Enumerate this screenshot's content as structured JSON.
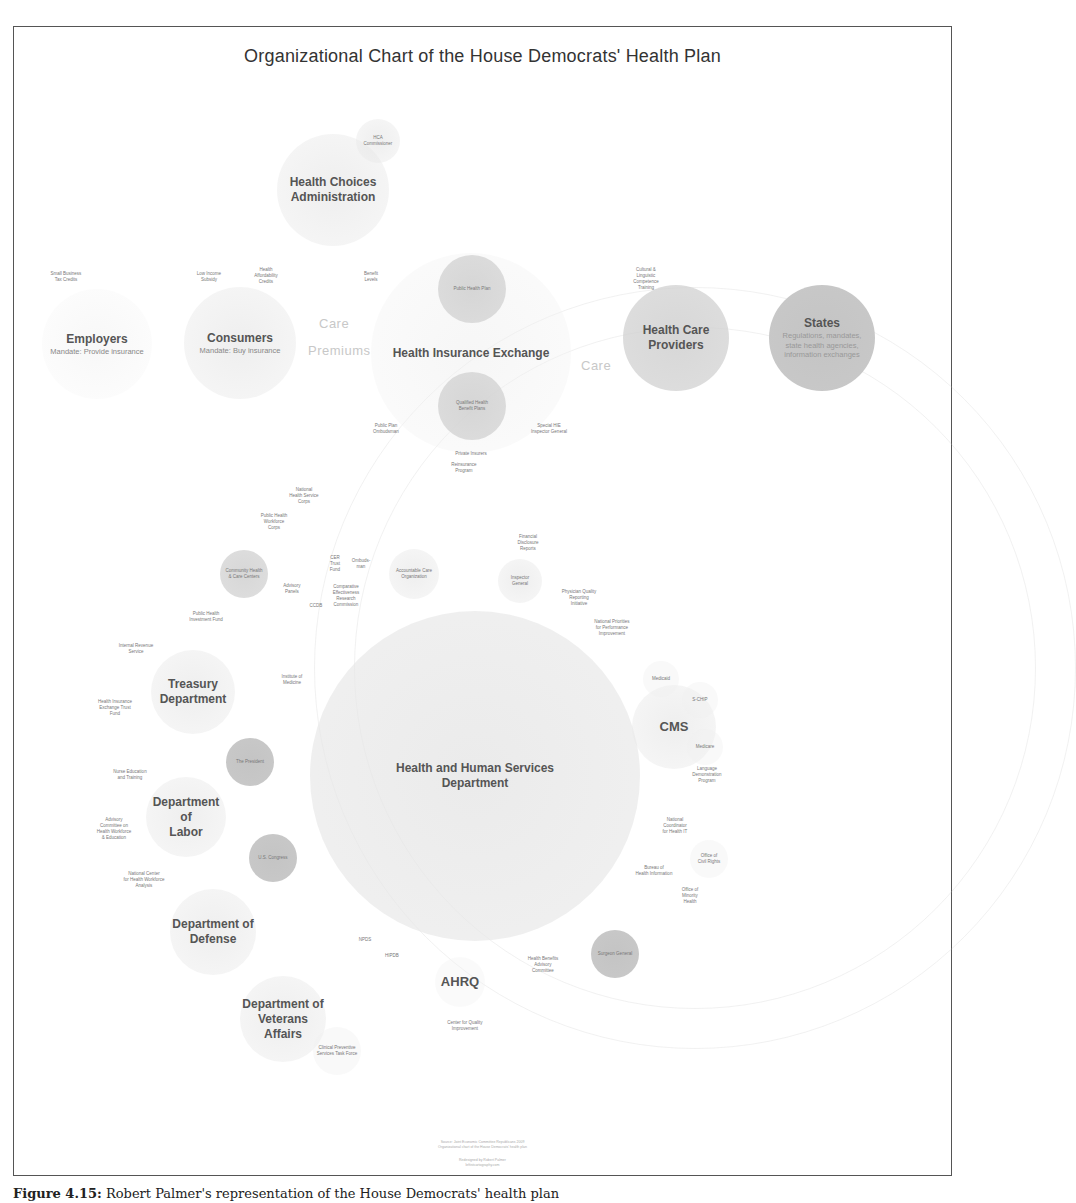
{
  "figure": {
    "title": "Organizational Chart of the House Democrats' Health Plan",
    "caption_label": "Figure 4.15:",
    "caption_text": "Robert Palmer's representation of the House Democrats' health plan"
  },
  "colors": {
    "frame_border": "#555555",
    "title_text": "#333333",
    "node_light": "#e6e6e6",
    "node_dark": "#c6c6c6",
    "label_text": "#555555",
    "flow_text": "#c8c8c8"
  },
  "top_nodes": {
    "health_choices_admin": {
      "label_line1": "Health Choices",
      "label_line2": "Administration"
    },
    "hca_commissioner": {
      "label_line1": "HCA",
      "label_line2": "Commissioner"
    },
    "employers": {
      "label": "Employers",
      "sublabel": "Mandate: Provide insurance"
    },
    "small_business_tax_credits": "Small Business\nTax Credits",
    "consumers": {
      "label": "Consumers",
      "sublabel": "Mandate: Buy insurance"
    },
    "low_income_subsidy": "Low Income\nSubsidy",
    "health_affordability_credits": "Health\nAffordability\nCredits",
    "benefit_levels": "Benefit\nLevels",
    "flow_care_left": "Care",
    "flow_premiums": "Premiums",
    "health_insurance_exchange": {
      "label": "Health Insurance Exchange"
    },
    "public_health_plan": "Public Health Plan",
    "qualified_health_benefit_plans": "Qualified Health\nBenefit Plans",
    "public_plan_ombudsman": "Public Plan\nOmbudsman",
    "special_ig": "Special HIE\nInspector General",
    "private_insurers": "Private Insurers",
    "flow_care_right": "Care",
    "health_care_providers": {
      "label_line1": "Health Care",
      "label_line2": "Providers"
    },
    "cultural_linguistic_training": "Cultural &\nLinguistic\nCompetence\nTraining",
    "states": {
      "label": "States",
      "sublabel_line1": "Regulations, mandates,",
      "sublabel_line2": "state health agencies,",
      "sublabel_line3": "information exchanges"
    }
  },
  "hhs_cluster": {
    "hhs": {
      "label_line1": "Health and Human Services",
      "label_line2": "Department"
    },
    "reinsurance_program": "Reinsurance\nProgram",
    "national_health_service_corps": "National\nHealth Service\nCorps",
    "public_health_workforce_corps": "Public Health\nWorkforce\nCorps",
    "community_health_centers": "Community Health\n& Care Centers",
    "cer_trust_fund": "CER\nTrust\nFund",
    "ombudsman": "Ombuds-\nman",
    "accountable_care_org": "Accountable Care\nOrganization",
    "financial_disclosure_reports": "Financial\nDisclosure\nReports",
    "inspector_general": "Inspector\nGeneral",
    "advisory_panels": "Advisory\nPanels",
    "cer_commission": "Comparative\nEffectiveness\nResearch\nCommission",
    "ccdb": "CCDB",
    "physician_quality_reporting": "Physician Quality\nReporting\nInitiative",
    "national_priorities": "National Priorities\nfor Performance\nImprovement",
    "public_health_investment_fund": "Public Health\nInvestment Fund",
    "institute_of_medicine": "Institute of\nMedicine",
    "cms": {
      "label": "CMS"
    },
    "medicaid": "Medicaid",
    "schip": "S-CHIP",
    "medicare": "Medicare",
    "language_demo_program": "Language\nDemonstration\nProgram",
    "national_coordinator_hit": "National\nCoordinator\nfor Health IT",
    "office_civil_rights": "Office of\nCivil Rights",
    "bureau_health_info": "Bureau of\nHealth Information",
    "office_minority_health": "Office of\nMinority\nHealth",
    "surgeon_general": "Surgeon General",
    "nphs": "NPDS",
    "hipdb": "HIPDB",
    "ahrq": {
      "label": "AHRQ"
    },
    "health_benefits_advisory": "Health Benefits\nAdvisory\nCommittee",
    "center_quality_improvement": "Center for Quality\nImprovement"
  },
  "left_cluster": {
    "treasury": {
      "label_line1": "Treasury",
      "label_line2": "Department"
    },
    "irs": "Internal Revenue\nService",
    "hie_trust_fund": "Health Insurance\nExchange Trust\nFund",
    "the_president": "The President",
    "nurse_education": "Nurse Education\nand Training",
    "labor": {
      "label_line1": "Department of",
      "label_line2": "Labor"
    },
    "advisory_committee_workforce": "Advisory\nCommittee on\nHealth Workforce\n& Education",
    "us_congress": "U.S. Congress",
    "national_center_workforce": "National Center\nfor Health Workforce\nAnalysis",
    "defense": {
      "label_line1": "Department of",
      "label_line2": "Defense"
    },
    "veterans": {
      "label_line1": "Department of",
      "label_line2": "Veterans",
      "label_line3": "Affairs"
    },
    "clinical_preventive_task_force": "Clinical Preventive\nServices Task Force"
  },
  "footer": {
    "line1": "Source: Joint Economic Committee Republicans 2009",
    "line2": "Organizational chart of the House Democrats' health plan",
    "line3": "Redesigned by Robert Palmer",
    "line4": "leftistcartography.com"
  }
}
